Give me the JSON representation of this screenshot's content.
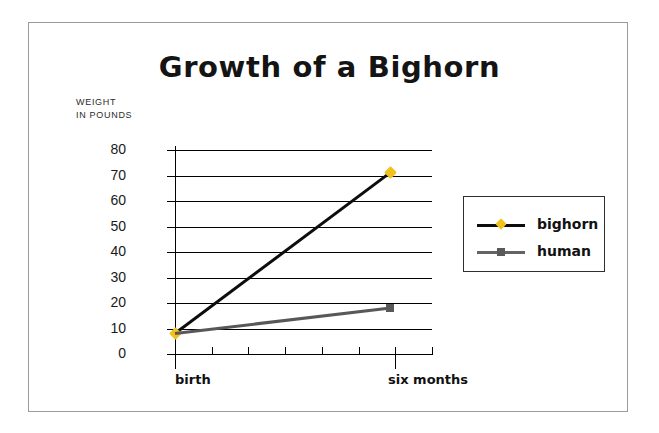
{
  "chart_data": {
    "type": "line",
    "title": "Growth of a Bighorn",
    "ylabel_line1": "WEIGHT",
    "ylabel_line2": "IN POUNDS",
    "xlabel": "",
    "categories": [
      "birth",
      "six months"
    ],
    "x": [
      0,
      1
    ],
    "series": [
      {
        "name": "bighorn",
        "values": [
          8,
          71
        ],
        "color": "#0d0d0d",
        "marker": "diamond",
        "marker_color": "#f2c21c"
      },
      {
        "name": "human",
        "values": [
          8,
          18
        ],
        "color": "#585858",
        "marker": "square",
        "marker_color": "#595959"
      }
    ],
    "ylim": [
      0,
      80
    ],
    "ytick_labels": [
      "80",
      "70",
      "60",
      "50",
      "40",
      "30",
      "20",
      "10",
      "0"
    ],
    "ytick_values": [
      80,
      70,
      60,
      50,
      40,
      30,
      20,
      10,
      0
    ],
    "xtick_count": 8,
    "xtick_major_indices": [
      0,
      6
    ],
    "grid": "horizontal",
    "legend_position": "right",
    "legend_entries": [
      "bighorn",
      "human"
    ]
  },
  "frame": {
    "border_color": "#9a9a9a",
    "background": "#ffffff"
  }
}
